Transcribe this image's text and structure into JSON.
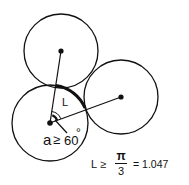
{
  "diagram": {
    "arc_label": "L",
    "angle_label_prefix": "a",
    "angle_relation": "≥",
    "angle_value": "60",
    "angle_unit": "°",
    "formula": {
      "lhs": "L",
      "relation": "≥",
      "numerator": "π",
      "denominator": "3",
      "result": "= 1.047"
    },
    "circles": [
      {
        "name": "top",
        "cx": 61,
        "cy": 51,
        "r": 37
      },
      {
        "name": "bottom-left",
        "cx": 50,
        "cy": 123,
        "r": 38
      },
      {
        "name": "right",
        "cx": 121,
        "cy": 97,
        "r": 37
      }
    ],
    "stroke_color": "#111111"
  }
}
